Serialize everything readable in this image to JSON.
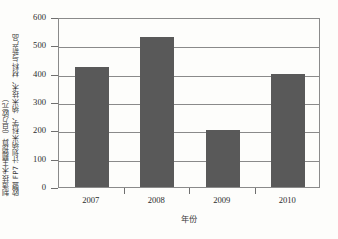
{
  "chart_data": {
    "type": "bar",
    "title": "",
    "categories": [
      "2007",
      "2008",
      "2009",
      "2010"
    ],
    "values": [
      425,
      530,
      200,
      400
    ],
    "series": [
      {
        "name": "预算",
        "values": [
          425,
          530,
          200,
          400
        ]
      }
    ],
    "xlabel": "年份",
    "ylabel_line1": "欧盟 FP7 计划纳米科学、纳米技术、材料与新产品",
    "ylabel_line2": "制造技术主题预算（百万欧元）",
    "ylim": [
      0,
      600
    ],
    "ytick_labels": [
      "0",
      "100",
      "200",
      "300",
      "400",
      "500",
      "600"
    ],
    "ytick_values": [
      0,
      100,
      200,
      300,
      400,
      500,
      600
    ],
    "grid": true,
    "legend": "none",
    "bar_color": "#595959",
    "axis_color": "#8a8a8a",
    "background_color": "#fdfdfb"
  }
}
